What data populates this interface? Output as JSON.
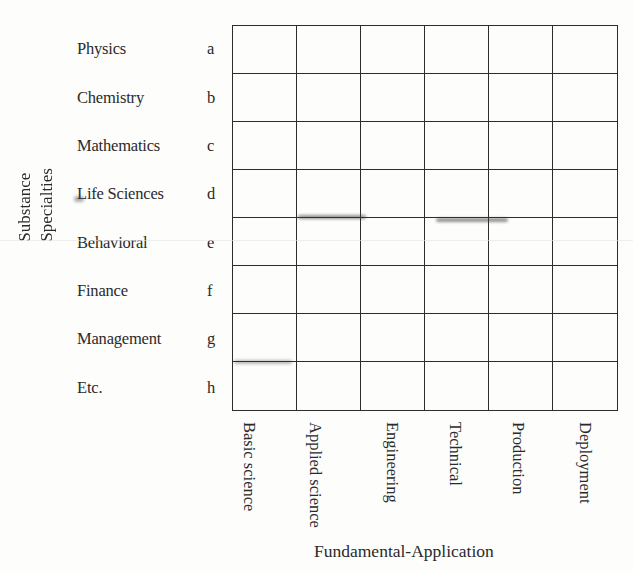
{
  "diagram": {
    "y_axis_title": [
      "Substance",
      "Specialties"
    ],
    "x_axis_title": "Fundamental-Application",
    "rows": [
      {
        "label": "Physics",
        "letter": "a"
      },
      {
        "label": "Chemistry",
        "letter": "b"
      },
      {
        "label": "Mathematics",
        "letter": "c"
      },
      {
        "label": "Life Sciences",
        "letter": "d"
      },
      {
        "label": "Behavioral",
        "letter": "e"
      },
      {
        "label": "Finance",
        "letter": "f"
      },
      {
        "label": "Management",
        "letter": "g"
      },
      {
        "label": "Etc.",
        "letter": "h"
      }
    ],
    "columns": [
      {
        "lines": [
          "Basic",
          "science"
        ]
      },
      {
        "lines": [
          "Applied",
          "science"
        ]
      },
      {
        "lines": [
          "Engineering"
        ]
      },
      {
        "lines": [
          "Technical"
        ]
      },
      {
        "lines": [
          "Production"
        ]
      },
      {
        "lines": [
          "Deployment"
        ]
      }
    ],
    "grid": {
      "rows": 8,
      "columns": 6,
      "line_color": "#2c2c2c"
    }
  }
}
